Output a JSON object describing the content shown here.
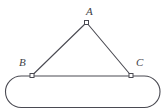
{
  "figure": {
    "name": "triangle-on-rounded-bar-diagram",
    "canvas": {
      "width": 166,
      "height": 112,
      "background": "#ffffff"
    },
    "style": {
      "stroke_color": "#4a4a52",
      "stroke_width": 1.1,
      "marker_fill": "#ffffff",
      "marker_size": 4,
      "label_color": "#3f3f47",
      "label_font_size": 11
    },
    "labels": {
      "apex": "A",
      "left": "B",
      "right": "C"
    },
    "points": {
      "A": {
        "x": 86.5,
        "y": 22.5
      },
      "B": {
        "x": 32.0,
        "y": 75.5
      },
      "C": {
        "x": 131.0,
        "y": 75.5
      }
    },
    "edges": [
      {
        "name": "segment-AB",
        "from": "A",
        "to": "B"
      },
      {
        "name": "segment-AC",
        "from": "A",
        "to": "C"
      }
    ],
    "bar": {
      "name": "rounded-bar",
      "left": 5.5,
      "top": 76.0,
      "right": 160.0,
      "bottom": 107.5,
      "corner_radius": 15.75,
      "shape": "stadium"
    }
  }
}
